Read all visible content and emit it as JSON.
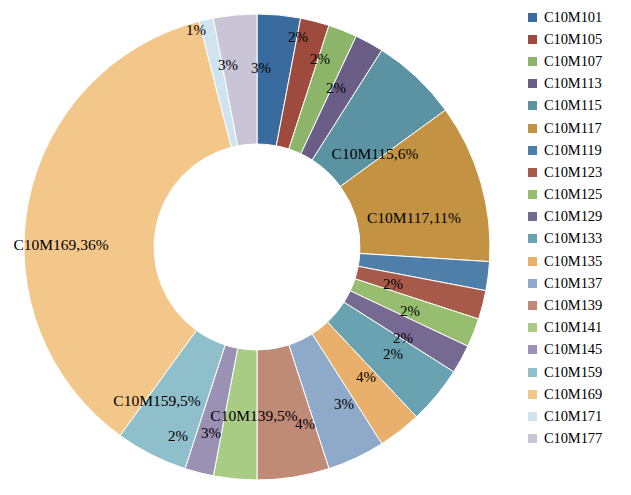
{
  "chart_data": {
    "type": "pie",
    "variant": "doughnut",
    "title": "",
    "xlabel": "",
    "ylabel": "",
    "legend_position": "right",
    "grid": false,
    "total_percent": 100,
    "categories": [
      "C10M101",
      "C10M105",
      "C10M107",
      "C10M113",
      "C10M115",
      "C10M117",
      "C10M119",
      "C10M123",
      "C10M125",
      "C10M129",
      "C10M133",
      "C10M135",
      "C10M137",
      "C10M139",
      "C10M141",
      "C10M145",
      "C10M159",
      "C10M169",
      "C10M171",
      "C10M177"
    ],
    "values": [
      3,
      2,
      2,
      2,
      6,
      11,
      2,
      2,
      2,
      2,
      4,
      3,
      4,
      5,
      3,
      2,
      5,
      36,
      1,
      3
    ],
    "colors": [
      "#3a6b9e",
      "#9e4a3c",
      "#8cb56a",
      "#6b5e86",
      "#5b93a3",
      "#c39242",
      "#4f7fa8",
      "#a85a4a",
      "#96be6e",
      "#776a92",
      "#69a3b2",
      "#e8b06a",
      "#8fa9c9",
      "#bf8a76",
      "#a8cc84",
      "#9a91b5",
      "#8fbfcb",
      "#f3c68a",
      "#cfe4ee",
      "#c9c4d6"
    ],
    "slice_labels": [
      {
        "text": "3%",
        "x": 261,
        "y": 68
      },
      {
        "text": "2%",
        "x": 298,
        "y": 37
      },
      {
        "text": "2%",
        "x": 320,
        "y": 59
      },
      {
        "text": "2%",
        "x": 336,
        "y": 88
      },
      {
        "text": "C10M115,6%",
        "x": 375,
        "y": 154
      },
      {
        "text": "C10M117,11%",
        "x": 414,
        "y": 218
      },
      {
        "text": "2%",
        "x": 393,
        "y": 284
      },
      {
        "text": "2%",
        "x": 410,
        "y": 311
      },
      {
        "text": "2%",
        "x": 403,
        "y": 338
      },
      {
        "text": "2%",
        "x": 393,
        "y": 354
      },
      {
        "text": "4%",
        "x": 366,
        "y": 377
      },
      {
        "text": "3%",
        "x": 344,
        "y": 404
      },
      {
        "text": "4%",
        "x": 305,
        "y": 424
      },
      {
        "text": "C10M139,5%",
        "x": 254,
        "y": 416
      },
      {
        "text": "3%",
        "x": 211,
        "y": 433
      },
      {
        "text": "2%",
        "x": 178,
        "y": 436
      },
      {
        "text": "C10M159,5%",
        "x": 157,
        "y": 401
      },
      {
        "text": "C10M169,36%",
        "x": 61,
        "y": 245
      },
      {
        "text": "1%",
        "x": 196,
        "y": 30
      },
      {
        "text": "3%",
        "x": 228,
        "y": 65
      }
    ]
  },
  "legend": {
    "items": [
      {
        "label": "C10M101",
        "color": "#3a6b9e"
      },
      {
        "label": "C10M105",
        "color": "#9e4a3c"
      },
      {
        "label": "C10M107",
        "color": "#8cb56a"
      },
      {
        "label": "C10M113",
        "color": "#6b5e86"
      },
      {
        "label": "C10M115",
        "color": "#5b93a3"
      },
      {
        "label": "C10M117",
        "color": "#c39242"
      },
      {
        "label": "C10M119",
        "color": "#4f7fa8"
      },
      {
        "label": "C10M123",
        "color": "#a85a4a"
      },
      {
        "label": "C10M125",
        "color": "#96be6e"
      },
      {
        "label": "C10M129",
        "color": "#776a92"
      },
      {
        "label": "C10M133",
        "color": "#69a3b2"
      },
      {
        "label": "C10M135",
        "color": "#e8b06a"
      },
      {
        "label": "C10M137",
        "color": "#8fa9c9"
      },
      {
        "label": "C10M139",
        "color": "#bf8a76"
      },
      {
        "label": "C10M141",
        "color": "#a8cc84"
      },
      {
        "label": "C10M145",
        "color": "#9a91b5"
      },
      {
        "label": "C10M159",
        "color": "#8fbfcb"
      },
      {
        "label": "C10M169",
        "color": "#f3c68a"
      },
      {
        "label": "C10M171",
        "color": "#cfe4ee"
      },
      {
        "label": "C10M177",
        "color": "#c9c4d6"
      }
    ]
  }
}
